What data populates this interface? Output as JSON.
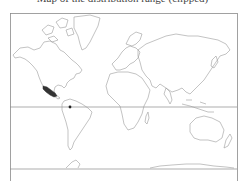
{
  "caption": {
    "text": "Map of the distribution range (clipped)",
    "visible": "partially clipped at top edge"
  },
  "map": {
    "projection": "Mercator world map",
    "frame": {
      "x": 10,
      "y": 13,
      "width": 227,
      "height": 168
    },
    "reference_lines": [
      {
        "name": "equator",
        "y": 107
      },
      {
        "name": "southern-parallel",
        "y": 169
      }
    ],
    "colors": {
      "outline": "#9a9a9a",
      "frame": "#8a8a8a",
      "highlight": "#333333",
      "background": "#ffffff"
    },
    "highlighted_regions": [
      {
        "name": "western-mexico-range",
        "fill": "#333333"
      },
      {
        "name": "northern-south-america-point",
        "fill": "#222222"
      }
    ]
  }
}
